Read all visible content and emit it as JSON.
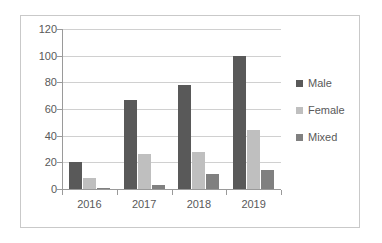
{
  "chart_data": {
    "type": "bar",
    "title": "",
    "subtitle": "",
    "xlabel": "",
    "ylabel": "",
    "categories": [
      "2016",
      "2017",
      "2018",
      "2019"
    ],
    "series": [
      {
        "name": "Male",
        "values": [
          20,
          67,
          78,
          100
        ],
        "color": "#595959"
      },
      {
        "name": "Female",
        "values": [
          8,
          26,
          28,
          44
        ],
        "color": "#bfbfbf"
      },
      {
        "name": "Mixed",
        "values": [
          1,
          3,
          11,
          14
        ],
        "color": "#808080"
      }
    ],
    "ylim": [
      0,
      120
    ],
    "yticks": [
      0,
      20,
      40,
      60,
      80,
      100,
      120
    ],
    "ytick_labels": [
      "0",
      "20",
      "40",
      "60",
      "80",
      "100",
      "120"
    ],
    "grid": true,
    "grid_axis": "y",
    "legend_position": "right",
    "legend_entries": [
      "Male",
      "Female",
      "Mixed"
    ],
    "plot_border": "#c9c9c9",
    "axis_color": "#9a9a9a",
    "gridline_color": "#d0d0d0",
    "text_color": "#595959",
    "background": "#ffffff"
  }
}
